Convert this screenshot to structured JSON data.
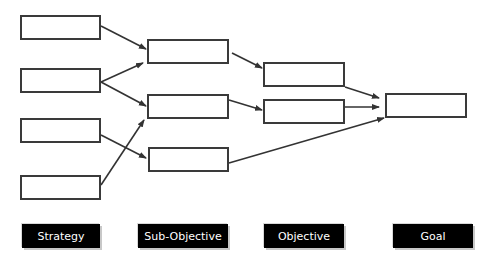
{
  "diagram": {
    "type": "hierarchy-flow",
    "columns": [
      {
        "id": "strategy",
        "label": "Strategy",
        "nodes": [
          "s1",
          "s2",
          "s3",
          "s4"
        ]
      },
      {
        "id": "sub-objective",
        "label": "Sub-Objective",
        "nodes": [
          "so1",
          "so2",
          "so3"
        ]
      },
      {
        "id": "objective",
        "label": "Objective",
        "nodes": [
          "o1",
          "o2"
        ]
      },
      {
        "id": "goal",
        "label": "Goal",
        "nodes": [
          "g1"
        ]
      }
    ],
    "edges": [
      [
        "s1",
        "so1"
      ],
      [
        "s2",
        "so1"
      ],
      [
        "s2",
        "so2"
      ],
      [
        "s3",
        "so3"
      ],
      [
        "s4",
        "so2"
      ],
      [
        "so1",
        "o1"
      ],
      [
        "so2",
        "o2"
      ],
      [
        "so3",
        "g1"
      ],
      [
        "o1",
        "g1"
      ],
      [
        "o2",
        "g1"
      ]
    ]
  },
  "labels": {
    "strategy": "Strategy",
    "sub_objective": "Sub-Objective",
    "objective": "Objective",
    "goal": "Goal"
  },
  "colors": {
    "box_border": "#3a3a3a",
    "label_bg": "#000000",
    "label_text": "#ffffff"
  }
}
